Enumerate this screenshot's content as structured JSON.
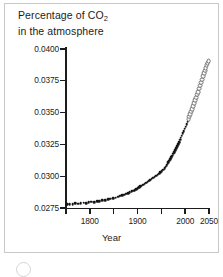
{
  "chart_data": {
    "type": "scatter",
    "title": "Percentage of CO2 in the atmosphere",
    "title_line1_pre": "Percentage of CO",
    "title_line1_sub": "2",
    "title_line2": "in the atmosphere",
    "xlabel": "Year",
    "ylabel": "",
    "xlim": [
      1750,
      2050
    ],
    "ylim": [
      0.0275,
      0.04
    ],
    "grid": false,
    "legend": null,
    "y_ticks": [
      0.0275,
      0.03,
      0.0325,
      0.035,
      0.0375,
      0.04
    ],
    "y_tick_labels": [
      "0.0275",
      "0.0300",
      "0.0325",
      "0.0350",
      "0.0375",
      "0.0400"
    ],
    "x_ticks": [
      1750,
      1800,
      1850,
      1900,
      1950,
      2000,
      2050
    ],
    "x_tick_labels": [
      "",
      "1800",
      "",
      "1900",
      "",
      "2000",
      "2050"
    ],
    "series": [
      {
        "name": "measured",
        "marker": "filled-circle",
        "x": [
          1752,
          1758,
          1764,
          1769,
          1775,
          1781,
          1787,
          1792,
          1798,
          1803,
          1809,
          1815,
          1820,
          1826,
          1832,
          1838,
          1843,
          1849,
          1854,
          1859,
          1864,
          1868,
          1872,
          1876,
          1880,
          1884,
          1888,
          1891,
          1894,
          1897,
          1900,
          1903,
          1906,
          1909,
          1912,
          1915,
          1918,
          1921,
          1924,
          1927,
          1930,
          1933,
          1936,
          1939,
          1942,
          1945,
          1948,
          1951,
          1954,
          1957,
          1959,
          1961,
          1963,
          1965,
          1967,
          1969,
          1971,
          1973,
          1975,
          1977,
          1979,
          1981,
          1983,
          1985,
          1987,
          1989,
          1991,
          1993,
          1995,
          1997,
          1999,
          2001,
          2003,
          2005
        ],
        "y": [
          0.0278,
          0.02782,
          0.02778,
          0.0279,
          0.02784,
          0.02788,
          0.02792,
          0.02786,
          0.02796,
          0.028,
          0.02795,
          0.02804,
          0.02802,
          0.0281,
          0.02812,
          0.02818,
          0.02822,
          0.02828,
          0.02832,
          0.0284,
          0.02846,
          0.02852,
          0.02856,
          0.02862,
          0.02868,
          0.02874,
          0.0288,
          0.02886,
          0.02892,
          0.02898,
          0.02906,
          0.02912,
          0.0292,
          0.02926,
          0.02934,
          0.0294,
          0.02948,
          0.02956,
          0.02964,
          0.02972,
          0.0298,
          0.02988,
          0.02996,
          0.03004,
          0.03012,
          0.0302,
          0.0303,
          0.0304,
          0.03052,
          0.03064,
          0.03074,
          0.03086,
          0.03098,
          0.0311,
          0.03122,
          0.03134,
          0.03148,
          0.03162,
          0.03176,
          0.0319,
          0.03206,
          0.0322,
          0.03236,
          0.03252,
          0.03268,
          0.03286,
          0.03302,
          0.03318,
          0.03336,
          0.03354,
          0.03372,
          0.0339,
          0.03408,
          0.03428
        ]
      },
      {
        "name": "projected",
        "marker": "open-circle",
        "x": [
          2007,
          2009,
          2011,
          2013,
          2015,
          2017,
          2019,
          2021,
          2023,
          2025,
          2027,
          2029,
          2031,
          2033,
          2035,
          2037,
          2039,
          2041,
          2043,
          2045,
          2047,
          2049
        ],
        "y": [
          0.03448,
          0.03468,
          0.03488,
          0.03508,
          0.0353,
          0.03552,
          0.03574,
          0.03596,
          0.03618,
          0.03642,
          0.03664,
          0.03688,
          0.03712,
          0.03736,
          0.0376,
          0.03784,
          0.03808,
          0.0383,
          0.03852,
          0.03872,
          0.03888,
          0.03902
        ]
      }
    ]
  }
}
